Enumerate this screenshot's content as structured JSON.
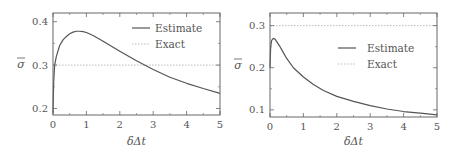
{
  "chart_data": [
    {
      "type": "line",
      "title": "",
      "xlabel": "δΔt",
      "ylabel": "σ̄",
      "xlim": [
        0,
        5
      ],
      "ylim": [
        0.185,
        0.42
      ],
      "xticks": [
        0,
        1,
        2,
        3,
        4,
        5
      ],
      "yticks": [
        0.2,
        0.3,
        0.4
      ],
      "ytick_labels": [
        "0.2",
        "0.3",
        "0.4"
      ],
      "grid": false,
      "legend_position": "upper right",
      "frame": {
        "x0": 53,
        "x1": 220,
        "y0": 13,
        "y1": 115
      },
      "legend": {
        "x": 132,
        "y": 28,
        "label_x": 155,
        "row_gap": 16
      },
      "series": [
        {
          "name": "Estimate",
          "style": "solid",
          "color": "#555555",
          "x": [
            0.0,
            0.02,
            0.05,
            0.1,
            0.2,
            0.3,
            0.4,
            0.5,
            0.6,
            0.7,
            0.8,
            0.9,
            1.0,
            1.2,
            1.5,
            2.0,
            2.5,
            3.0,
            3.5,
            4.0,
            4.5,
            5.0
          ],
          "y": [
            0.19,
            0.26,
            0.3,
            0.32,
            0.345,
            0.358,
            0.366,
            0.372,
            0.376,
            0.378,
            0.378,
            0.377,
            0.375,
            0.368,
            0.355,
            0.332,
            0.31,
            0.29,
            0.272,
            0.258,
            0.246,
            0.235
          ]
        },
        {
          "name": "Exact",
          "style": "dotted",
          "color": "#bbbbbb",
          "x": [
            0,
            5
          ],
          "y": [
            0.3,
            0.3
          ]
        }
      ]
    },
    {
      "type": "line",
      "title": "",
      "xlabel": "δΔt",
      "ylabel": "σ̄",
      "xlim": [
        0,
        5
      ],
      "ylim": [
        0.083,
        0.33
      ],
      "xticks": [
        0,
        1,
        2,
        3,
        4,
        5
      ],
      "yticks": [
        0.1,
        0.2,
        0.3
      ],
      "ytick_labels": [
        "0.1",
        "0.2",
        "0.3"
      ],
      "grid": false,
      "legend_position": "center right",
      "frame": {
        "x0": 270,
        "x1": 437,
        "y0": 13,
        "y1": 117
      },
      "legend": {
        "x": 338,
        "y": 48,
        "label_x": 367,
        "row_gap": 16
      },
      "series": [
        {
          "name": "Estimate",
          "style": "solid",
          "color": "#555555",
          "x": [
            0.0,
            0.02,
            0.05,
            0.1,
            0.15,
            0.2,
            0.3,
            0.4,
            0.5,
            0.7,
            1.0,
            1.3,
            1.6,
            2.0,
            2.5,
            3.0,
            3.5,
            4.0,
            4.5,
            5.0
          ],
          "y": [
            0.2,
            0.25,
            0.265,
            0.27,
            0.268,
            0.262,
            0.25,
            0.236,
            0.222,
            0.2,
            0.178,
            0.16,
            0.146,
            0.132,
            0.12,
            0.11,
            0.102,
            0.096,
            0.092,
            0.088
          ]
        },
        {
          "name": "Exact",
          "style": "dotted",
          "color": "#bbbbbb",
          "x": [
            0,
            5
          ],
          "y": [
            0.3,
            0.3
          ]
        }
      ]
    }
  ]
}
